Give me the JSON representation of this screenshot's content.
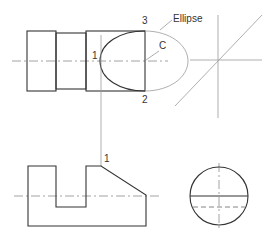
{
  "diagram": {
    "labels": {
      "point1_top": "1",
      "point2": "2",
      "point3": "3",
      "pointC": "C",
      "ellipse": "Ellipse",
      "point1_bottom": "1"
    },
    "colors": {
      "outline": "#333333",
      "construction": "#9a9a9a",
      "background": "#ffffff"
    }
  }
}
